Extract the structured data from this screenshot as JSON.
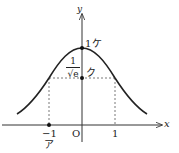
{
  "figure": {
    "type": "function-graph",
    "curve": "y = e^{-x^2/2}",
    "axes": {
      "x_label": "x",
      "y_label": "y",
      "origin_label": "O"
    },
    "x_ticks": [
      {
        "value": -1,
        "label": "−1",
        "marker": "ア"
      },
      {
        "value": 1,
        "label": "1"
      }
    ],
    "points": [
      {
        "label": "1",
        "marker": "ケ",
        "x": 0,
        "y": 1
      },
      {
        "label_numerator": "1",
        "label_denominator": "√e",
        "marker": "ク",
        "x": 0,
        "y": "1/√e"
      }
    ],
    "guide_lines": "dashed lines from (−1, 1/√e) and (1, 1/√e) to the axes",
    "colors": {
      "curve": "#222222",
      "axes": "#333333",
      "dashed": "#555555"
    }
  }
}
